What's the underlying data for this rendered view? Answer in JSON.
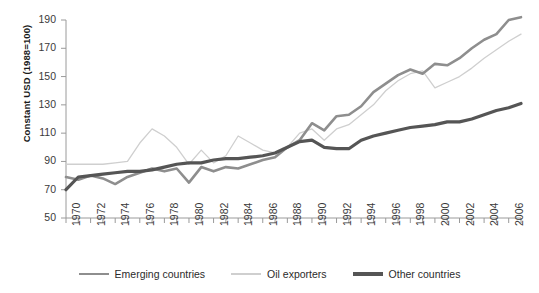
{
  "chart_data": {
    "type": "line",
    "title": "",
    "xlabel": "",
    "ylabel": "Constant USD (1988=100)",
    "ylim": [
      50,
      190
    ],
    "yticks": [
      50,
      70,
      90,
      110,
      130,
      150,
      170,
      190
    ],
    "xlim": [
      1970,
      2007
    ],
    "xticks": [
      1970,
      1971,
      1972,
      1973,
      1974,
      1975,
      1976,
      1977,
      1978,
      1979,
      1980,
      1981,
      1982,
      1983,
      1984,
      1985,
      1986,
      1987,
      1988,
      1989,
      1990,
      1991,
      1992,
      1993,
      1994,
      1995,
      1996,
      1997,
      1998,
      1999,
      2000,
      2001,
      2002,
      2003,
      2004,
      2005,
      2006,
      2007
    ],
    "xtick_labels": [
      "1970",
      "1972",
      "1974",
      "1976",
      "1978",
      "1980",
      "1982",
      "1984",
      "1986",
      "1988",
      "1990",
      "1992",
      "1994",
      "1996",
      "1998",
      "2000",
      "2002",
      "2004",
      "2006"
    ],
    "xtick_label_years": [
      1970,
      1972,
      1974,
      1976,
      1978,
      1980,
      1982,
      1984,
      1986,
      1988,
      1990,
      1992,
      1994,
      1996,
      1998,
      2000,
      2002,
      2004,
      2006
    ],
    "grid": false,
    "legend_position": "bottom",
    "x": [
      1970,
      1971,
      1972,
      1973,
      1974,
      1975,
      1976,
      1977,
      1978,
      1979,
      1980,
      1981,
      1982,
      1983,
      1984,
      1985,
      1986,
      1987,
      1988,
      1989,
      1990,
      1991,
      1992,
      1993,
      1994,
      1995,
      1996,
      1997,
      1998,
      1999,
      2000,
      2001,
      2002,
      2003,
      2004,
      2005,
      2006,
      2007
    ],
    "series": [
      {
        "name": "Emerging countries",
        "color": "#8e8e8e",
        "width": 2.6,
        "values": [
          79,
          77,
          80,
          78,
          74,
          79,
          82,
          85,
          83,
          85,
          75,
          86,
          83,
          86,
          85,
          88,
          91,
          93,
          100,
          105,
          117,
          112,
          122,
          123,
          129,
          139,
          145,
          151,
          155,
          152,
          159,
          158,
          163,
          170,
          176,
          180,
          190,
          192
        ]
      },
      {
        "name": "Oil exporters",
        "color": "#cfcfcf",
        "width": 1.3,
        "values": [
          88,
          88,
          88,
          88,
          89,
          90,
          103,
          113,
          108,
          100,
          88,
          98,
          89,
          94,
          108,
          103,
          98,
          96,
          100,
          110,
          113,
          105,
          113,
          116,
          123,
          130,
          140,
          147,
          152,
          154,
          142,
          146,
          150,
          156,
          163,
          169,
          175,
          180
        ]
      },
      {
        "name": "Other countries",
        "color": "#555555",
        "width": 3.2,
        "values": [
          70,
          79,
          80,
          81,
          82,
          83,
          83,
          84,
          86,
          88,
          89,
          89,
          91,
          92,
          92,
          93,
          94,
          96,
          100,
          104,
          105,
          100,
          99,
          99,
          105,
          108,
          110,
          112,
          114,
          115,
          116,
          118,
          118,
          120,
          123,
          126,
          128,
          131
        ]
      }
    ]
  },
  "legend": {
    "items": [
      {
        "label": "Emerging countries"
      },
      {
        "label": "Oil exporters"
      },
      {
        "label": "Other countries"
      }
    ]
  }
}
